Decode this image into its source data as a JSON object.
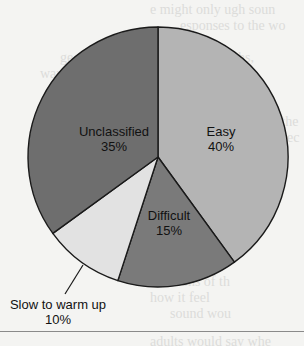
{
  "chart_data": {
    "type": "pie",
    "title": "",
    "categories": [
      "Easy",
      "Difficult",
      "Slow to warm up",
      "Unclassified"
    ],
    "values": [
      40,
      15,
      10,
      35
    ],
    "unit": "%",
    "labels": [
      "Easy\n40%",
      "Difficult\n15%",
      "Slow to warm up\n10%",
      "Unclassified\n35%"
    ],
    "start_angle_deg": 0,
    "direction": "clockwise",
    "colors": [
      "#b4b4b4",
      "#7a7a7a",
      "#e2e2e2",
      "#6e6e6e"
    ],
    "legend": "none (inline labels)"
  },
  "slices": [
    {
      "name": "Easy",
      "pct": "40%"
    },
    {
      "name": "Difficult",
      "pct": "15%"
    },
    {
      "name": "Slow to warm up",
      "pct": "10%"
    },
    {
      "name": "Unclassified",
      "pct": "35%"
    }
  ]
}
